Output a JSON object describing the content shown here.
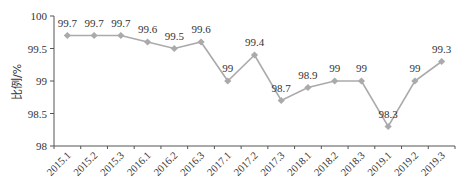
{
  "chart_data": {
    "type": "line",
    "title": "",
    "xlabel": "",
    "ylabel": "比例/%",
    "ylim": [
      98,
      100
    ],
    "yticks": [
      98,
      98.5,
      99,
      99.5,
      100
    ],
    "grid": false,
    "legend": null,
    "categories": [
      "2015.1",
      "2015.2",
      "2015.3",
      "2016.1",
      "2016.2",
      "2016.3",
      "2017.1",
      "2017.2",
      "2017.3",
      "2018.1",
      "2018.2",
      "2018.3",
      "2019.1",
      "2019.2",
      "2019.3"
    ],
    "series": [
      {
        "name": "比例",
        "values": [
          99.7,
          99.7,
          99.7,
          99.6,
          99.5,
          99.6,
          99,
          99.4,
          98.7,
          98.9,
          99,
          99,
          98.3,
          99,
          99.3
        ],
        "labels": [
          "99.7",
          "99.7",
          "99.7",
          "99.6",
          "99.5",
          "99.6",
          "99",
          "99.4",
          "98.7",
          "98.9",
          "99",
          "99",
          "98.3",
          "99",
          "99.3"
        ],
        "color": "#aaaaaa",
        "marker": "diamond"
      }
    ]
  }
}
